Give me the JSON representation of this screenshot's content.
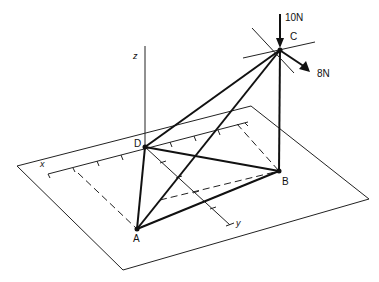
{
  "diagram": {
    "type": "3D truss / tripod on plane",
    "points": {
      "A": {
        "label": "A"
      },
      "B": {
        "label": "B"
      },
      "C": {
        "label": "C"
      },
      "D": {
        "label": "D"
      }
    },
    "axes": {
      "x": "x",
      "y": "y",
      "z": "z"
    },
    "forces": [
      {
        "at": "C",
        "label": "10N",
        "direction": "down"
      },
      {
        "at": "C",
        "label": "8N",
        "direction": "down-right"
      }
    ],
    "members": [
      "AC",
      "AD",
      "AB",
      "BD",
      "CD",
      "BC"
    ]
  }
}
